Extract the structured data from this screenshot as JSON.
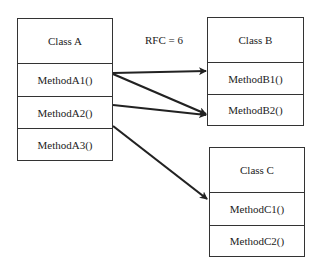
{
  "annotation": "RFC = 6",
  "classes": {
    "a": {
      "name": "Class A",
      "methods": [
        "MethodA1()",
        "MethodA2()",
        "MethodA3()"
      ]
    },
    "b": {
      "name": "Class B",
      "methods": [
        "MethodB1()",
        "MethodB2()"
      ]
    },
    "c": {
      "name": "Class C",
      "methods": [
        "MethodC1()",
        "MethodC2()"
      ]
    }
  },
  "arrows": [
    {
      "from": "MethodA1()",
      "to": "MethodB1()"
    },
    {
      "from": "MethodA1()",
      "to": "MethodB2()"
    },
    {
      "from": "MethodA2()",
      "to": "MethodB2()"
    },
    {
      "from": "MethodA3()",
      "to": "MethodC1()"
    }
  ]
}
